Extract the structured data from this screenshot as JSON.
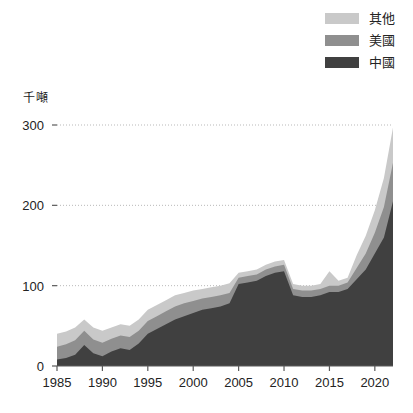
{
  "chart_data": {
    "type": "area",
    "stacked": true,
    "title": "",
    "subtitle": "",
    "xlabel": "",
    "ylabel": "千噸",
    "unit_label": "千噸",
    "grid": true,
    "legend_position": "top-right",
    "xlim": [
      1985,
      2022
    ],
    "ylim": [
      0,
      300
    ],
    "yticks": [
      0,
      100,
      200,
      300
    ],
    "ytick_labels": [
      "0",
      "100",
      "200",
      "300"
    ],
    "xticks": [
      1985,
      1990,
      1995,
      2000,
      2005,
      2010,
      2015,
      2020
    ],
    "xtick_labels": [
      "1985",
      "1990",
      "1995",
      "2000",
      "2005",
      "2010",
      "2015",
      "2020"
    ],
    "x": [
      1985,
      1986,
      1987,
      1988,
      1989,
      1990,
      1991,
      1992,
      1993,
      1994,
      1995,
      1996,
      1997,
      1998,
      1999,
      2000,
      2001,
      2002,
      2003,
      2004,
      2005,
      2006,
      2007,
      2008,
      2009,
      2010,
      2011,
      2012,
      2013,
      2014,
      2015,
      2016,
      2017,
      2018,
      2019,
      2020,
      2021,
      2022
    ],
    "series": [
      {
        "name": "中國",
        "color": "#404040",
        "values": [
          8,
          10,
          14,
          26,
          16,
          12,
          18,
          22,
          20,
          28,
          40,
          46,
          52,
          58,
          62,
          66,
          70,
          72,
          74,
          78,
          102,
          104,
          106,
          112,
          116,
          118,
          88,
          86,
          86,
          88,
          92,
          92,
          96,
          108,
          120,
          140,
          160,
          205
        ]
      },
      {
        "name": "美國",
        "color": "#8f8f8f",
        "values": [
          16,
          17,
          18,
          18,
          17,
          17,
          16,
          16,
          16,
          16,
          16,
          16,
          16,
          16,
          16,
          15,
          14,
          14,
          14,
          13,
          8,
          8,
          8,
          8,
          8,
          8,
          8,
          8,
          8,
          8,
          8,
          8,
          8,
          14,
          20,
          26,
          38,
          48
        ]
      },
      {
        "name": "其他",
        "color": "#c9c9c9",
        "values": [
          16,
          16,
          16,
          14,
          15,
          15,
          14,
          14,
          14,
          14,
          14,
          14,
          14,
          14,
          13,
          13,
          12,
          12,
          12,
          12,
          6,
          6,
          6,
          6,
          6,
          6,
          6,
          6,
          6,
          6,
          18,
          6,
          6,
          16,
          22,
          28,
          36,
          44
        ]
      }
    ],
    "totals": [
      40,
      43,
      48,
      58,
      48,
      44,
      48,
      52,
      50,
      58,
      70,
      76,
      82,
      88,
      91,
      94,
      96,
      98,
      100,
      103,
      116,
      118,
      120,
      126,
      130,
      132,
      102,
      100,
      100,
      102,
      118,
      106,
      110,
      138,
      162,
      194,
      234,
      297
    ]
  },
  "legend": {
    "items": [
      {
        "label": "其他",
        "color": "#c9c9c9"
      },
      {
        "label": "美國",
        "color": "#8f8f8f"
      },
      {
        "label": "中國",
        "color": "#404040"
      }
    ]
  },
  "colors": {
    "background": "#ffffff",
    "axis": "#5a5a5a",
    "grid": "#b9b9b9",
    "text": "#232323"
  }
}
